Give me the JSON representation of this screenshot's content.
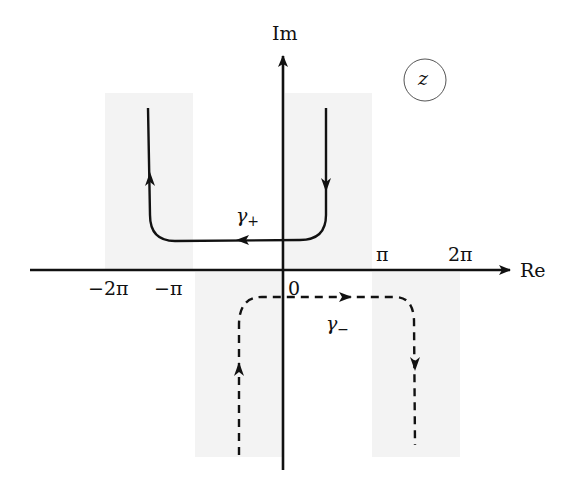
{
  "diagram": {
    "type": "complex-plane-contours",
    "axes": {
      "x_label": "Re",
      "y_label": "Im",
      "ticks": [
        {
          "label": "−2π",
          "x": 110
        },
        {
          "label": "−π",
          "x": 170
        },
        {
          "label": "0",
          "x": 293
        },
        {
          "label": "π",
          "x": 384
        },
        {
          "label": "2π",
          "x": 461
        }
      ]
    },
    "plane_label": "z",
    "contours": [
      {
        "name": "γ+",
        "label_main": "γ",
        "label_sub": "+",
        "style": "solid",
        "direction": "right-branch down, horizontal leftward, left-branch up"
      },
      {
        "name": "γ−",
        "label_main": "γ",
        "label_sub": "−",
        "style": "dashed",
        "direction": "left-branch up, horizontal rightward, right-branch down"
      }
    ],
    "shaded_regions": [
      {
        "position": "upper-left"
      },
      {
        "position": "upper-right"
      },
      {
        "position": "lower-left"
      },
      {
        "position": "lower-right"
      }
    ],
    "colors": {
      "ink": "#111111",
      "shade": "#f2f2f2",
      "background": "#ffffff"
    }
  }
}
